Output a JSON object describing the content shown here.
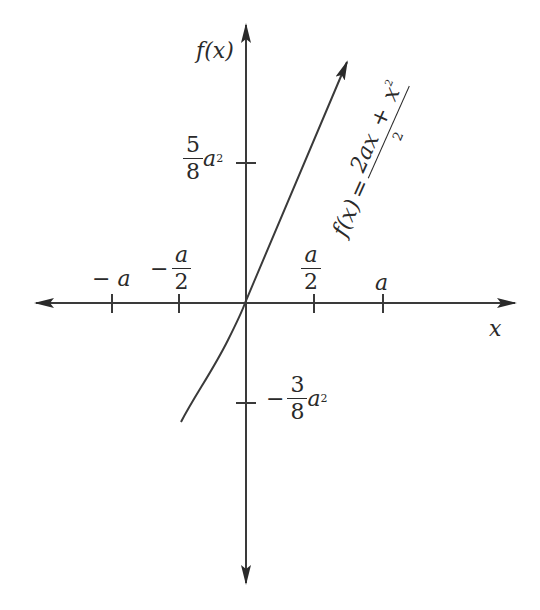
{
  "diagram": {
    "type": "function-graph",
    "y_axis_label": "f(x)",
    "x_axis_label": "x",
    "curve_label": {
      "lhs": "f(x)",
      "equals": "=",
      "numerator_a": "2ax",
      "numerator_plus": "+",
      "numerator_b": "x",
      "numerator_b_exp": "2",
      "denominator": "2"
    },
    "x_ticks": [
      {
        "label": "− a",
        "value": "-a"
      },
      {
        "label_num": "a",
        "label_den": "2",
        "sign": "−",
        "value": "-a/2"
      },
      {
        "label_num": "a",
        "label_den": "2",
        "value": "a/2"
      },
      {
        "label": "a",
        "value": "a"
      }
    ],
    "y_ticks": [
      {
        "num": "5",
        "den": "8",
        "var": "a",
        "exp": "2",
        "value": "5/8 a^2"
      },
      {
        "sign": "−",
        "num": "3",
        "den": "8",
        "var": "a",
        "exp": "2",
        "value": "-3/8 a^2"
      }
    ],
    "colors": {
      "ink": "#2a2a2a",
      "background": "#ffffff"
    }
  }
}
